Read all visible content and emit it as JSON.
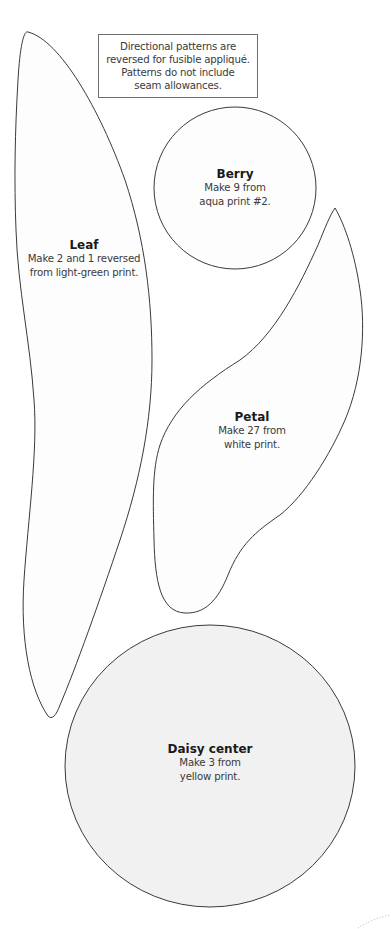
{
  "note": {
    "lines": [
      "Directional patterns are",
      "reversed for fusible appliqué.",
      "Patterns do not include",
      "seam allowances."
    ]
  },
  "shapes": {
    "leaf": {
      "title": "Leaf",
      "lines": [
        "Make 2 and 1 reversed",
        "from light-green print."
      ]
    },
    "berry": {
      "title": "Berry",
      "lines": [
        "Make 9 from",
        "aqua print #2."
      ]
    },
    "petal": {
      "title": "Petal",
      "lines": [
        "Make 27 from",
        "white print."
      ]
    },
    "daisy_center": {
      "title": "Daisy center",
      "lines": [
        "Make 3 from",
        "yellow print."
      ]
    }
  },
  "colors": {
    "outline": "#3a3a3a",
    "shape_fill": "#fdfdfd",
    "daisy_fill": "#f1f1f1",
    "background": "#ffffff"
  }
}
